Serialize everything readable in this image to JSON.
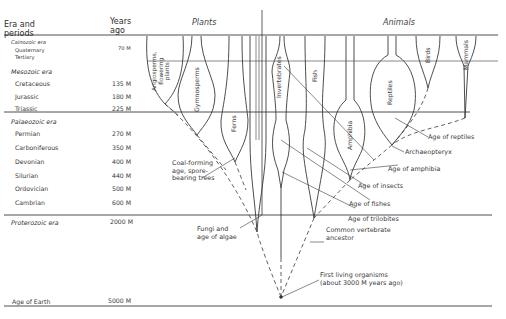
{
  "header": {
    "era_col": [
      "Era and",
      "periods"
    ],
    "years_col": [
      "Years",
      "ago"
    ],
    "plants_title": "Plants",
    "animals_title": "Animals"
  },
  "eras": [
    {
      "name": "Cainozoic era",
      "periods": [
        {
          "name": "Quaternary",
          "years": ""
        },
        {
          "name": "Tertiary",
          "years": "70 M"
        }
      ]
    },
    {
      "name": "Mesozoic era",
      "periods": [
        {
          "name": "Cretaceous",
          "years": "135 M"
        },
        {
          "name": "Jurassic",
          "years": "180 M"
        },
        {
          "name": "Triassic",
          "years": "225 M"
        }
      ]
    },
    {
      "name": "Palaeozoic era",
      "periods": [
        {
          "name": "Permian",
          "years": "270 M"
        },
        {
          "name": "Carboniferous",
          "years": "350 M"
        },
        {
          "name": "Devonian",
          "years": "400 M"
        },
        {
          "name": "Silurian",
          "years": "440 M"
        },
        {
          "name": "Ordovician",
          "years": "500 M"
        },
        {
          "name": "Cambrian",
          "years": "600 M"
        }
      ]
    },
    {
      "name": "Proterozoic era",
      "years": "2000 M"
    }
  ],
  "age_of_earth": {
    "label": "Age of Earth",
    "years": "5000 M"
  },
  "lineages": {
    "plants": [
      {
        "name": "Angiosperms, flowering plants",
        "lines": [
          "Angiosperms,",
          "flowering",
          "plants"
        ]
      },
      {
        "name": "Gymnosperms"
      },
      {
        "name": "Ferns"
      }
    ],
    "animals": [
      {
        "name": "Invertebrates"
      },
      {
        "name": "Fish"
      },
      {
        "name": "Amphibia"
      },
      {
        "name": "Reptiles"
      },
      {
        "name": "Birds"
      },
      {
        "name": "Mammals"
      }
    ]
  },
  "annotations": {
    "coal": [
      "Coal-forming",
      "age, spore-",
      "bearing trees"
    ],
    "fungi": [
      "Fungi and",
      "age of algae"
    ],
    "vertebrate": [
      "Common vertebrate",
      "ancestor"
    ],
    "first_life": [
      "First living organisms",
      "(about 3000 M years ago)"
    ],
    "reptiles_age": "Age of reptiles",
    "archaeopteryx": "Archaeopteryx",
    "amphibia_age": "Age of amphibia",
    "insects_age": "Age of insects",
    "fishes_age": "Age of fishes",
    "trilobites_age": "Age of trilobites"
  },
  "colors": {
    "ink": "#2a2a2a",
    "rule": "#555555",
    "background": "#ffffff"
  }
}
